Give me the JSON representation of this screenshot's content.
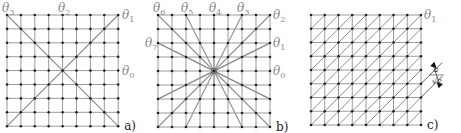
{
  "figure": {
    "panels": [
      {
        "id": "a",
        "label": "a)",
        "grid": {
          "x0": 7,
          "y0": 15,
          "step": 13.9,
          "n": 9
        },
        "angle_labels": [
          {
            "text": "θ",
            "sub": "3",
            "x": 2,
            "y": 12
          },
          {
            "text": "θ",
            "sub": "2",
            "x": 58,
            "y": 12
          },
          {
            "text": "θ",
            "sub": "1",
            "x": 122,
            "y": 19
          },
          {
            "text": "θ",
            "sub": "0",
            "x": 122,
            "y": 75
          }
        ],
        "lines": "two-diagonals"
      },
      {
        "id": "b",
        "label": "b)",
        "grid": {
          "x0": 158,
          "y0": 15,
          "step": 14,
          "n": 9
        },
        "angle_labels": [
          {
            "text": "θ",
            "sub": "6",
            "x": 153,
            "y": 12
          },
          {
            "text": "θ",
            "sub": "5",
            "x": 181,
            "y": 12
          },
          {
            "text": "θ",
            "sub": "4",
            "x": 209,
            "y": 12
          },
          {
            "text": "θ",
            "sub": "3",
            "x": 237,
            "y": 12
          },
          {
            "text": "θ",
            "sub": "2",
            "x": 273,
            "y": 19
          },
          {
            "text": "θ",
            "sub": "1",
            "x": 273,
            "y": 47
          },
          {
            "text": "θ",
            "sub": "0",
            "x": 273,
            "y": 75
          },
          {
            "text": "θ",
            "sub": "7",
            "x": 145,
            "y": 47
          }
        ],
        "lines": "star-16-directions"
      },
      {
        "id": "c",
        "label": "c)",
        "grid": {
          "x0": 311,
          "y0": 15,
          "step": 13.75,
          "n": 9
        },
        "angle_labels": [
          {
            "text": "θ",
            "sub": "1",
            "x": 424,
            "y": 19
          }
        ],
        "lines": "all-diagonals",
        "dimension": {
          "numerator": "a",
          "denominator": "√2"
        }
      }
    ]
  }
}
